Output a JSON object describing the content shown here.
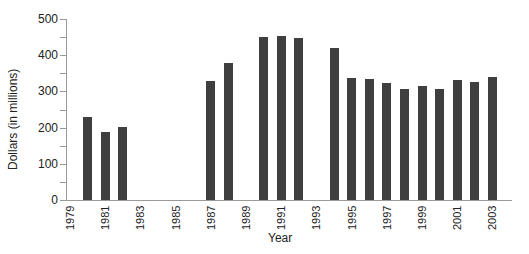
{
  "chart_data": {
    "type": "bar",
    "title": "",
    "xlabel": "Year",
    "ylabel": "Dollars (in millions)",
    "ylim": [
      0,
      500
    ],
    "yticks": [
      0,
      100,
      200,
      300,
      400,
      500
    ],
    "xtick_labels": [
      "1979",
      "1981",
      "1983",
      "1985",
      "1987",
      "1989",
      "1991",
      "1993",
      "1995",
      "1997",
      "1999",
      "2001",
      "2003"
    ],
    "grid": false,
    "legend": null,
    "categories": [
      "1980",
      "1981",
      "1982",
      "1987",
      "1988",
      "1990",
      "1991",
      "1992",
      "1994",
      "1995",
      "1996",
      "1997",
      "1998",
      "1999",
      "2000",
      "2001",
      "2002",
      "2003"
    ],
    "values": [
      230,
      189,
      203,
      329,
      378,
      450,
      453,
      447,
      420,
      336,
      334,
      322,
      308,
      316,
      306,
      331,
      325,
      339
    ],
    "bar_color": "#3f3f3f"
  }
}
